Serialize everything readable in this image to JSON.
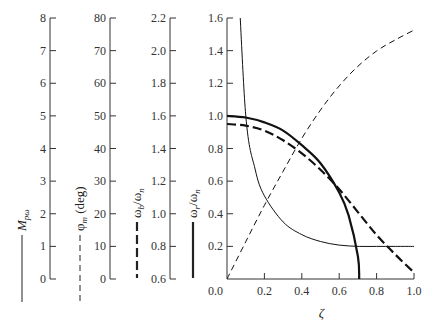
{
  "chart_data": {
    "type": "line",
    "title": "",
    "xlabel": "ζ",
    "x_ticks": [
      "0.0",
      "0.2",
      "0.4",
      "0.6",
      "0.8",
      "1.0"
    ],
    "xlim": [
      0,
      1
    ],
    "main_axis": {
      "ylim": [
        0,
        1.6
      ],
      "y_ticks": [
        "0.0",
        "0.2",
        "0.4",
        "0.6",
        "0.8",
        "1.0",
        "1.2",
        "1.4",
        "1.6"
      ],
      "label": "ω_r/ω_n",
      "legend_style": "thick-solid"
    },
    "secondary_axes": [
      {
        "id": "M",
        "label": "M_pω",
        "legend_style": "thin-solid",
        "ylim": [
          0,
          8
        ],
        "y_ticks": [
          "0",
          "1",
          "2",
          "3",
          "4",
          "5",
          "6",
          "7",
          "8"
        ]
      },
      {
        "id": "phi",
        "label": "φ_m (deg)",
        "legend_style": "thin-dashed",
        "ylim": [
          0,
          80
        ],
        "y_ticks": [
          "0",
          "10",
          "20",
          "30",
          "40",
          "50",
          "60",
          "70",
          "80"
        ]
      },
      {
        "id": "wb",
        "label": "ω_b/ω_n",
        "legend_style": "thick-dashed",
        "ylim": [
          0.6,
          2.2
        ],
        "y_ticks": [
          "0.6",
          "0.8",
          "1.0",
          "1.2",
          "1.4",
          "1.6",
          "1.8",
          "2.0",
          "2.2"
        ]
      }
    ],
    "series": [
      {
        "name": "M_pω",
        "style": "thin-solid",
        "x": [
          0.05,
          0.1,
          0.15,
          0.2,
          0.3,
          0.4,
          0.5,
          0.6,
          0.707,
          0.8,
          0.9,
          1.0
        ],
        "values": [
          10.0,
          5.03,
          3.37,
          2.55,
          1.75,
          1.36,
          1.15,
          1.04,
          1.0,
          1.0,
          1.0,
          1.0
        ]
      },
      {
        "name": "φ_m (deg)",
        "style": "thin-dashed",
        "x": [
          0.0,
          0.1,
          0.2,
          0.3,
          0.4,
          0.5,
          0.6,
          0.7,
          0.8,
          0.9,
          1.0
        ],
        "values": [
          0,
          11.4,
          22.6,
          33.0,
          43.1,
          51.8,
          59.2,
          65.2,
          69.9,
          73.3,
          76.3
        ]
      },
      {
        "name": "ω_b/ω_n",
        "style": "thick-dashed",
        "x": [
          0.0,
          0.1,
          0.2,
          0.3,
          0.4,
          0.5,
          0.6,
          0.7,
          0.8,
          0.9,
          1.0
        ],
        "values": [
          1.55,
          1.54,
          1.51,
          1.45,
          1.37,
          1.27,
          1.15,
          1.01,
          0.87,
          0.75,
          0.64
        ]
      },
      {
        "name": "ω_r/ω_n",
        "style": "thick-solid",
        "x": [
          0.0,
          0.1,
          0.2,
          0.3,
          0.4,
          0.5,
          0.6,
          0.65,
          0.7,
          0.707
        ],
        "values": [
          1.0,
          0.99,
          0.96,
          0.91,
          0.82,
          0.71,
          0.53,
          0.39,
          0.14,
          0.0
        ]
      }
    ],
    "grid": false,
    "legend_position": "inline-vertical-left-of-axes"
  }
}
